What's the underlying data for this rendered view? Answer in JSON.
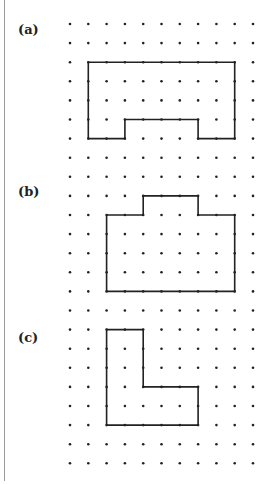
{
  "figure": {
    "labels": [
      {
        "id": "a",
        "text": "(a)",
        "y": 22
      },
      {
        "id": "b",
        "text": "(b)",
        "y": 184
      },
      {
        "id": "c",
        "text": "(c)",
        "y": 330
      }
    ],
    "grid": {
      "columns": 11,
      "rows": 24,
      "origin_x": 70,
      "origin_y": 24,
      "spacing_x": 18.3,
      "spacing_y": 19.1,
      "dot_color": "#222222",
      "line_color": "#222222"
    },
    "shapes": [
      {
        "id": "a",
        "points": [
          [
            1,
            2
          ],
          [
            9,
            2
          ],
          [
            9,
            6
          ],
          [
            7,
            6
          ],
          [
            7,
            5
          ],
          [
            3,
            5
          ],
          [
            3,
            6
          ],
          [
            1,
            6
          ]
        ]
      },
      {
        "id": "b",
        "points": [
          [
            2,
            10
          ],
          [
            4,
            10
          ],
          [
            4,
            9
          ],
          [
            7,
            9
          ],
          [
            7,
            10
          ],
          [
            9,
            10
          ],
          [
            9,
            14
          ],
          [
            2,
            14
          ]
        ]
      },
      {
        "id": "c",
        "points": [
          [
            2,
            16
          ],
          [
            4,
            16
          ],
          [
            4,
            19
          ],
          [
            7,
            19
          ],
          [
            7,
            21
          ],
          [
            2,
            21
          ]
        ]
      }
    ]
  }
}
